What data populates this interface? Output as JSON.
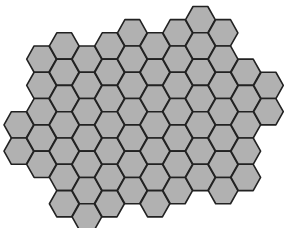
{
  "diagram": {
    "type": "hexagonal-tessellation",
    "orientation": "flat-top",
    "colors": {
      "fill": "#b1b1b1",
      "stroke": "#222222",
      "background": "#ffffff"
    },
    "geometry": {
      "origin_x": 4.0,
      "origin_y": 6.5,
      "column_step": 22.7,
      "half_row_step": 13.15,
      "hex_width": 29.6,
      "hex_height": 26.3,
      "stroke_width": 1.6
    },
    "columns": [
      {
        "col": 0,
        "h_start": 8,
        "h_end": 10
      },
      {
        "col": 1,
        "h_start": 3,
        "h_end": 11
      },
      {
        "col": 2,
        "h_start": 2,
        "h_end": 14
      },
      {
        "col": 3,
        "h_start": 3,
        "h_end": 15
      },
      {
        "col": 4,
        "h_start": 2,
        "h_end": 14
      },
      {
        "col": 5,
        "h_start": 1,
        "h_end": 13
      },
      {
        "col": 6,
        "h_start": 2,
        "h_end": 14
      },
      {
        "col": 7,
        "h_start": 1,
        "h_end": 13
      },
      {
        "col": 8,
        "h_start": 0,
        "h_end": 12
      },
      {
        "col": 9,
        "h_start": 1,
        "h_end": 13
      },
      {
        "col": 10,
        "h_start": 4,
        "h_end": 12
      },
      {
        "col": 11,
        "h_start": 5,
        "h_end": 7
      }
    ],
    "hex_count": 70
  }
}
